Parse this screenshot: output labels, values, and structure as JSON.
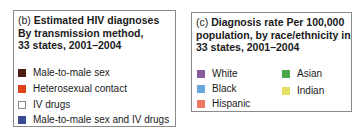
{
  "panel_b": {
    "prefix": "(b)",
    "title_line1": "Estimated HIV diagnoses",
    "title_line2": "By transmission method,",
    "title_line3": "33 states, 2001–2004",
    "items": [
      {
        "label": "Male-to-male sex",
        "color": "#4a1e14"
      },
      {
        "label": "Heterosexual contact",
        "color": "#e0401e"
      },
      {
        "label": "IV drugs",
        "color": "#ffffff"
      },
      {
        "label": "Male-to-male sex and IV drugs",
        "color": "#3a4a94"
      }
    ]
  },
  "panel_c": {
    "prefix": "(c)",
    "title_line1": "Diagnosis rate Per 100,000",
    "title_line2": "population, by race/ethnicity in",
    "title_line3": "33 states, 2001–2004",
    "items": [
      {
        "label": "White",
        "color": "#8a5c9c"
      },
      {
        "label": "Black",
        "color": "#6aa6dc"
      },
      {
        "label": "Hispanic",
        "color": "#ea7a64"
      },
      {
        "label": "Asian",
        "color": "#4aa84a"
      },
      {
        "label": "Indian",
        "color": "#e6e060"
      }
    ]
  }
}
